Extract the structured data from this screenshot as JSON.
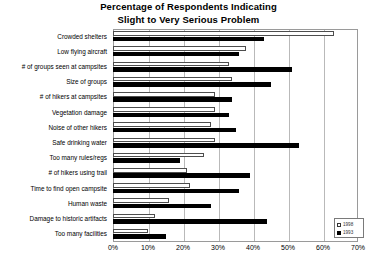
{
  "chart_data": {
    "type": "bar",
    "orientation": "horizontal",
    "title": "Percentage of Respondents Indicating Slight to Very Serious Problem",
    "title_line1": "Percentage of Respondents Indicating",
    "title_line2": "Slight to Very Serious Problem",
    "xlabel": "",
    "ylabel": "",
    "xlim": [
      0,
      70
    ],
    "xticks": [
      "0%",
      "10%",
      "20%",
      "30%",
      "40%",
      "50%",
      "60%",
      "70%"
    ],
    "xtick_values": [
      0,
      10,
      20,
      30,
      40,
      50,
      60,
      70
    ],
    "grid": true,
    "legend_position": "bottom-right",
    "categories": [
      "Crowded shelters",
      "Low flying aircraft",
      "# of groups seen at campsites",
      "Size of groups",
      "# of hikers at campsites",
      "Vegetation damage",
      "Noise of other hikers",
      "Safe drinking water",
      "Too many rules/regs",
      "# of hikers using trail",
      "Time to find open campsite",
      "Human waste",
      "Damage to historic artifacts",
      "Too many facilities"
    ],
    "series": [
      {
        "name": "1998",
        "color": "#ffffff",
        "edge_color": "#4d4d4d",
        "values": [
          63,
          38,
          33,
          34,
          29,
          29,
          28,
          29,
          26,
          21,
          22,
          16,
          12,
          10
        ]
      },
      {
        "name": "1993",
        "color": "#000000",
        "edge_color": "#000000",
        "values": [
          43,
          36,
          51,
          45,
          34,
          33,
          35,
          53,
          19,
          39,
          36,
          28,
          44,
          15
        ]
      }
    ]
  },
  "legend": {
    "items": [
      {
        "label": "1998",
        "swatch": "hollow-square"
      },
      {
        "label": "1993",
        "swatch": "filled-square"
      }
    ]
  },
  "colors": {
    "series_1998": "#ffffff",
    "series_1993": "#000000",
    "gridline": "#b9b9b9",
    "frame": "#9a9a9a",
    "background": "#ffffff",
    "text": "#000000"
  }
}
